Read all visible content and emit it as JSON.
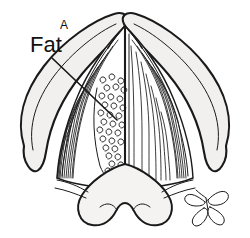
{
  "figure": {
    "kind": "anatomical-line-drawing",
    "panel_label": "A",
    "labels": [
      {
        "id": "fat",
        "text": "Fat",
        "x": 30,
        "y": 52,
        "leader_from_x": 52,
        "leader_from_y": 58,
        "leader_to_x": 117,
        "leader_to_y": 120
      }
    ],
    "panel_label_x": 64,
    "panel_label_y": 29,
    "colors": {
      "ink": "#1a1a1a",
      "background": "#ffffff",
      "wing_fill": "#f1f0ee",
      "base_fill": "#f4f3f1",
      "muscle_fill": "#ffffff"
    },
    "structures": [
      {
        "name": "left-wing",
        "description": "elongated teardrop, light gray fill"
      },
      {
        "name": "right-wing",
        "description": "elongated teardrop, light gray fill"
      },
      {
        "name": "apex",
        "description": "rounded midline peak"
      },
      {
        "name": "midline-septum",
        "description": "vertical line from apex to base"
      },
      {
        "name": "left-muscle-striations",
        "description": "curved fiber lines, left half"
      },
      {
        "name": "right-muscle-striations",
        "description": "curved fiber lines, right half"
      },
      {
        "name": "fat-region",
        "description": "curly adipose scribbles left of midline"
      },
      {
        "name": "base-bilobed",
        "description": "two rounded lobes with inward hooks"
      },
      {
        "name": "gland-cluster",
        "description": "four teardrop loops, lower right"
      }
    ],
    "geometry": {
      "width": 250,
      "height": 238,
      "left_wing_path": "M 22 128 C 16 106 30 76 52 54 C 76 30 106 16 124 14 C 132 14 136 18 133 24 C 124 40 96 62 76 88 C 58 112 48 140 44 162 C 40 180 28 176 24 160 C 21 148 22 136 22 128 Z",
      "right_wing_path": "M 228 128 C 234 106 220 76 198 54 C 174 30 144 16 126 14 C 118 14 114 18 117 24 C 126 40 154 62 174 88 C 192 112 202 140 206 162 C 210 180 222 176 226 160 C 229 148 228 136 228 128 Z",
      "core_path": "M 125 28 C 106 46 84 76 72 108 C 62 136 58 160 57 176 C 70 182 96 186 125 186 C 154 186 180 182 193 176 C 192 160 188 136 178 108 C 166 76 144 46 125 28 Z",
      "base_path": "M 125 166 C 140 170 158 184 166 196 C 174 208 170 222 158 224 C 148 226 140 218 136 210 C 133 204 129 202 125 202 C 121 202 117 204 114 210 C 110 218 102 226 92 224 C 80 222 76 208 84 196 C 92 184 110 170 125 166 Z",
      "midline_x": 125,
      "midline_top_y": 30,
      "midline_bottom_y": 200,
      "fat_cx": 112,
      "fat_cy": 118,
      "fat_rx": 18,
      "fat_ry": 44,
      "gland_cx": 207,
      "gland_cy": 205
    }
  }
}
